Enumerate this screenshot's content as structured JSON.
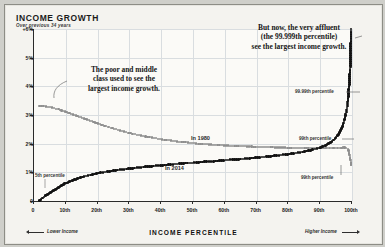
{
  "header": {
    "title": "INCOME GROWTH",
    "subtitle": "Over previous 34 years"
  },
  "footer": {
    "axis_title": "INCOME PERCENTILE",
    "left_label": "Lower Income",
    "right_label": "Higher Income"
  },
  "annotations": {
    "left_callout": "The poor and middle\nclass used to see the\nlargest income growth.",
    "right_callout": "But now, the very affluent\n(the 99.999th percentile)\nsee the largest income growth.",
    "series_1980_label": "In 1980",
    "series_2014_label": "In 2014",
    "pct_5th": "5th percentile",
    "pct_99th_upper": "99th percentile",
    "pct_99th_lower": "99th percentile",
    "pct_9999th": "99.99th percentile"
  },
  "colors": {
    "series_1980": "#8e8e8e",
    "series_2014": "#121212",
    "grid": "#d9dde0",
    "axis": "#2a2a2a",
    "card_bg": "#f4f3ef",
    "plot_bg": "#fbfaf7"
  },
  "chart_data": {
    "type": "line",
    "title": "INCOME GROWTH",
    "subtitle": "Over previous 34 years",
    "xlabel": "INCOME PERCENTILE",
    "ylabel": "",
    "xlim": [
      0,
      100
    ],
    "ylim": [
      0,
      6
    ],
    "grid": true,
    "legend_position": "inline",
    "yticks": [
      0,
      1,
      2,
      3,
      4,
      5,
      6
    ],
    "ytick_labels": [
      "0",
      "1%",
      "2%",
      "3%",
      "4%",
      "5%",
      "+6%"
    ],
    "xticks": [
      0,
      10,
      20,
      30,
      40,
      50,
      60,
      70,
      80,
      90,
      100
    ],
    "xtick_labels": [
      "0",
      "10th",
      "20th",
      "30th",
      "40th",
      "50th",
      "60th",
      "70th",
      "80th",
      "90th",
      "100th"
    ],
    "x": [
      2,
      4,
      6,
      8,
      10,
      12,
      14,
      16,
      18,
      20,
      22,
      24,
      26,
      28,
      30,
      32,
      34,
      36,
      38,
      40,
      42,
      44,
      46,
      48,
      50,
      52,
      54,
      56,
      58,
      60,
      62,
      64,
      66,
      68,
      70,
      72,
      74,
      76,
      78,
      80,
      82,
      84,
      86,
      88,
      90,
      91,
      92,
      93,
      94,
      95,
      96,
      97,
      97.5,
      98,
      98.5,
      99,
      99.2,
      99.4,
      99.6,
      99.8,
      99.9,
      99.95,
      99.99,
      99.999
    ],
    "series": [
      {
        "name": "In 1980",
        "color": "#8e8e8e",
        "values": [
          3.32,
          3.3,
          3.26,
          3.2,
          3.12,
          3.04,
          2.96,
          2.88,
          2.8,
          2.72,
          2.64,
          2.57,
          2.5,
          2.44,
          2.38,
          2.33,
          2.28,
          2.24,
          2.2,
          2.16,
          2.13,
          2.1,
          2.07,
          2.05,
          2.02,
          2.0,
          1.98,
          1.97,
          1.95,
          1.94,
          1.93,
          1.92,
          1.91,
          1.9,
          1.89,
          1.88,
          1.88,
          1.87,
          1.87,
          1.86,
          1.86,
          1.86,
          1.85,
          1.85,
          1.85,
          1.85,
          1.85,
          1.85,
          1.85,
          1.85,
          1.86,
          1.86,
          1.87,
          1.87,
          1.86,
          1.82,
          1.76,
          1.66,
          1.54,
          1.42,
          1.34,
          1.3,
          1.27,
          1.25
        ]
      },
      {
        "name": "In 2014",
        "color": "#121212",
        "values": [
          0.02,
          0.18,
          0.34,
          0.48,
          0.6,
          0.7,
          0.78,
          0.85,
          0.91,
          0.96,
          1.0,
          1.04,
          1.07,
          1.1,
          1.13,
          1.15,
          1.18,
          1.2,
          1.22,
          1.24,
          1.26,
          1.28,
          1.3,
          1.32,
          1.33,
          1.35,
          1.37,
          1.38,
          1.4,
          1.42,
          1.44,
          1.45,
          1.47,
          1.49,
          1.51,
          1.53,
          1.55,
          1.58,
          1.6,
          1.63,
          1.66,
          1.7,
          1.74,
          1.79,
          1.85,
          1.89,
          1.94,
          2.0,
          2.08,
          2.18,
          2.32,
          2.52,
          2.66,
          2.85,
          3.1,
          3.45,
          3.7,
          4.0,
          4.35,
          4.8,
          5.2,
          5.5,
          5.8,
          6.0
        ]
      }
    ]
  }
}
